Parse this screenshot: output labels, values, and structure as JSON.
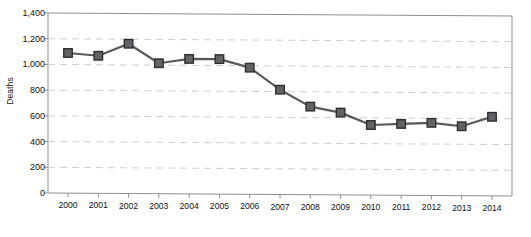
{
  "chart_data": {
    "type": "line",
    "title": "",
    "subtitle": "",
    "xlabel": "",
    "ylabel": "Deaths",
    "categories": [
      "2000",
      "2001",
      "2002",
      "2003",
      "2004",
      "2005",
      "2006",
      "2007",
      "2008",
      "2009",
      "2010",
      "2011",
      "2012",
      "2013",
      "2014"
    ],
    "values": [
      1090,
      1070,
      1165,
      1015,
      1050,
      1050,
      985,
      815,
      685,
      640,
      545,
      555,
      565,
      540,
      615
    ],
    "series": [
      {
        "name": "Deaths",
        "values": [
          1090,
          1070,
          1165,
          1015,
          1050,
          1050,
          985,
          815,
          685,
          640,
          545,
          555,
          565,
          540,
          615
        ]
      }
    ],
    "ylim": [
      0,
      1400
    ],
    "y_ticks": [
      0,
      200,
      400,
      600,
      800,
      1000,
      1200,
      1400
    ],
    "y_tick_labels": [
      "0",
      "200",
      "400",
      "600",
      "800",
      "1,000",
      "1,200",
      "1,400"
    ],
    "x_tick_labels": [
      "2000",
      "2001",
      "2002",
      "2003",
      "2004",
      "2005",
      "2006",
      "2007",
      "2008",
      "2009",
      "2010",
      "2011",
      "2012",
      "2013",
      "2014"
    ],
    "grid": "horizontal-dashed",
    "legend": "none",
    "marker": "square",
    "colors": {
      "line": "#5a5a5c",
      "marker_fill": "#636365",
      "marker_edge": "#2f2f31",
      "gridline": "#cfcfcf",
      "axis": "#8f8f8f",
      "text": "#111111"
    }
  },
  "axes": {
    "y_title": "Deaths"
  },
  "artifact": {
    "edge_text": ""
  }
}
